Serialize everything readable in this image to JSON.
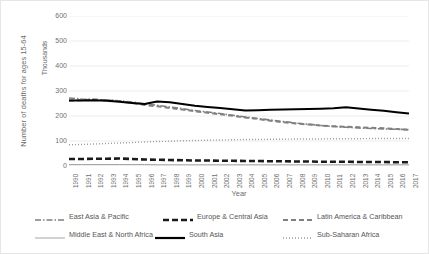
{
  "axes": {
    "y_title": "Number of deaths for ages 15-64",
    "y_units": "Thousands",
    "x_title": "Year"
  },
  "legend": {
    "rows": [
      [
        {
          "label": "East Asia & Pacific",
          "style": "dashdot",
          "color": "#7f7f7f",
          "width": 1.6
        },
        {
          "label": "Europe & Central Asia",
          "style": "dash",
          "color": "#1a1a1a",
          "width": 2.6
        },
        {
          "label": "Latin America & Caribbean",
          "style": "dash",
          "color": "#808080",
          "width": 2.0
        }
      ],
      [
        {
          "label": "Middle East & North Africa",
          "style": "solid",
          "color": "#a6a6a6",
          "width": 1.0
        },
        {
          "label": "South Asia",
          "style": "solid",
          "color": "#000000",
          "width": 2.2
        },
        {
          "label": "Sub-Saharan Africa",
          "style": "dot",
          "color": "#9a9a9a",
          "width": 1.4
        }
      ]
    ]
  },
  "chart_data": {
    "type": "line",
    "title": "",
    "xlabel": "Year",
    "ylabel": "Number of deaths for ages 15-64",
    "y_units": "Thousands",
    "ylim": [
      0,
      600
    ],
    "yticks": [
      0,
      100,
      200,
      300,
      400,
      500,
      600
    ],
    "ytick_labels": [
      "0",
      "100",
      "200",
      "300",
      "400",
      "500",
      "600"
    ],
    "grid": "horizontal",
    "legend_position": "bottom",
    "categories": [
      "1990",
      "1991",
      "1992",
      "1993",
      "1994",
      "1995",
      "1996",
      "1997",
      "1998",
      "1999",
      "2000",
      "2001",
      "2002",
      "2003",
      "2004",
      "2005",
      "2006",
      "2007",
      "2008",
      "2009",
      "2010",
      "2011",
      "2012",
      "2013",
      "2014",
      "2015",
      "2016",
      "2017"
    ],
    "series": [
      {
        "name": "East Asia & Pacific",
        "style": "dashdot",
        "color": "#7f7f7f",
        "width": 1.6,
        "values": [
          272,
          268,
          266,
          264,
          261,
          256,
          248,
          243,
          236,
          229,
          222,
          216,
          210,
          203,
          196,
          190,
          184,
          178,
          172,
          167,
          162,
          158,
          155,
          152,
          150,
          148,
          147,
          146
        ]
      },
      {
        "name": "Europe & Central Asia",
        "style": "dash",
        "color": "#1a1a1a",
        "width": 2.6,
        "values": [
          28,
          28,
          29,
          29,
          30,
          28,
          26,
          25,
          24,
          23,
          22,
          22,
          21,
          21,
          20,
          20,
          19,
          19,
          18,
          18,
          17,
          17,
          17,
          16,
          16,
          16,
          15,
          15
        ]
      },
      {
        "name": "Latin America & Caribbean",
        "style": "dash",
        "color": "#808080",
        "width": 2.0,
        "values": [
          262,
          263,
          266,
          263,
          259,
          253,
          244,
          239,
          232,
          226,
          219,
          213,
          207,
          201,
          194,
          188,
          181,
          175,
          170,
          166,
          162,
          159,
          157,
          155,
          153,
          151,
          148,
          145
        ]
      },
      {
        "name": "Middle East & North Africa",
        "style": "solid",
        "color": "#a6a6a6",
        "width": 1.0,
        "values": [
          6,
          6,
          6,
          6,
          6,
          6,
          6,
          5,
          5,
          5,
          5,
          5,
          5,
          5,
          5,
          5,
          5,
          5,
          5,
          5,
          5,
          5,
          5,
          5,
          5,
          5,
          5,
          5
        ]
      },
      {
        "name": "South Asia",
        "style": "solid",
        "color": "#000000",
        "width": 2.2,
        "values": [
          262,
          262,
          263,
          261,
          257,
          252,
          248,
          258,
          255,
          248,
          241,
          236,
          232,
          227,
          222,
          223,
          225,
          226,
          227,
          228,
          229,
          231,
          235,
          230,
          225,
          221,
          215,
          210
        ]
      },
      {
        "name": "Sub-Saharan Africa",
        "style": "dot",
        "color": "#9a9a9a",
        "width": 1.4,
        "values": [
          85,
          86,
          88,
          90,
          92,
          94,
          96,
          98,
          99,
          101,
          102,
          103,
          104,
          105,
          106,
          106,
          107,
          107,
          108,
          108,
          108,
          109,
          109,
          109,
          110,
          110,
          110,
          110
        ]
      }
    ]
  }
}
